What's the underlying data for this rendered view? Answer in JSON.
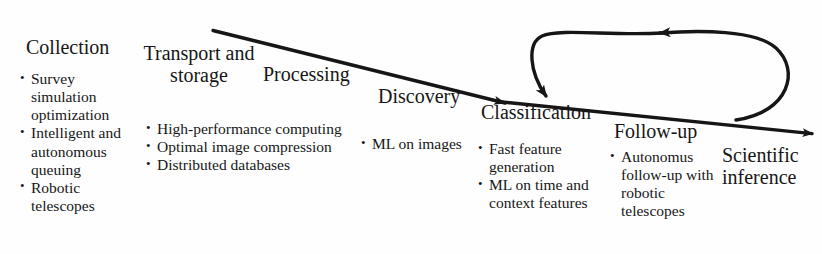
{
  "diagram": {
    "background_color": "#fefefe",
    "ink_color": "#161616",
    "stages": [
      {
        "id": "collection",
        "heading": "Collection",
        "bullets": [
          "Survey simulation optimization",
          "Intelligent and autonomous queuing",
          "Robotic telescopes"
        ]
      },
      {
        "id": "transport-and-storage",
        "heading_line_1": "Transport and",
        "heading_line_2": "storage",
        "heading": "Transport and storage",
        "bullets": [
          "High-performance computing",
          "Optimal image compression",
          "Distributed databases"
        ]
      },
      {
        "id": "processing",
        "heading": "Processing",
        "bullets": []
      },
      {
        "id": "discovery",
        "heading": "Discovery",
        "bullets": [
          "ML on images"
        ]
      },
      {
        "id": "classification",
        "heading": "Classification",
        "bullets": [
          "Fast feature generation",
          "ML on time and context features"
        ]
      },
      {
        "id": "follow-up",
        "heading": "Follow-up",
        "bullets": [
          "Autonomus follow-up with robotic telescopes"
        ]
      },
      {
        "id": "scientific-inference",
        "heading_line_1": "Scientific",
        "heading_line_2": "inference",
        "heading": "Scientific inference",
        "bullets": []
      }
    ],
    "arrows": {
      "main_flow": {
        "name": "main-pipeline-arrow",
        "direction": "left-to-right descending"
      },
      "feedback_loop": {
        "name": "follow-up-to-classification-loop",
        "direction": "from follow-up back to classification"
      }
    }
  }
}
